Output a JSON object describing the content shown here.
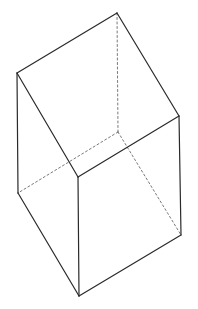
{
  "diagram": {
    "colors": {
      "background": "#ffffff",
      "visible_edge": "#2a2a2a",
      "hidden_edge": "#555555"
    },
    "vertices": {
      "A": [
        17,
        73
      ],
      "B": [
        117,
        13
      ],
      "C": [
        179,
        116
      ],
      "D": [
        78,
        177
      ],
      "E": [
        18,
        193
      ],
      "F": [
        79,
        296
      ],
      "G": [
        181,
        235
      ],
      "H": [
        118,
        132
      ]
    },
    "visible_edges": [
      [
        "A",
        "B"
      ],
      [
        "B",
        "C"
      ],
      [
        "C",
        "D"
      ],
      [
        "D",
        "A"
      ],
      [
        "A",
        "E"
      ],
      [
        "E",
        "F"
      ],
      [
        "F",
        "G"
      ],
      [
        "G",
        "C"
      ],
      [
        "D",
        "F"
      ]
    ],
    "hidden_edges": [
      [
        "B",
        "H"
      ],
      [
        "H",
        "E"
      ],
      [
        "H",
        "G"
      ]
    ]
  }
}
